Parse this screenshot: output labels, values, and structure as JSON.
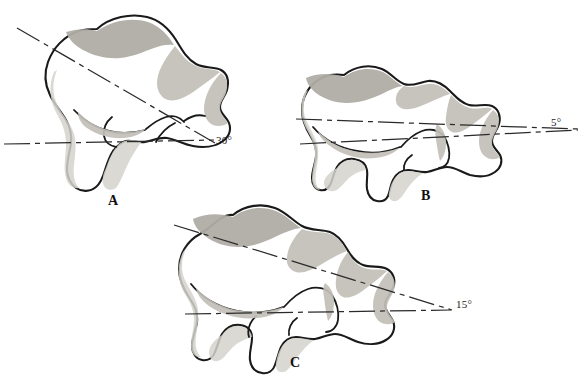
{
  "figure": {
    "background_color": "#ffffff",
    "outline_color": "#1a1a1a",
    "shading_color": "#b8b5ae",
    "width": 585,
    "height": 380
  },
  "panels": [
    {
      "id": "panel-a",
      "label": "A",
      "label_x": 108,
      "label_y": 193,
      "angle_text": "30°",
      "angle_value": 30,
      "angle_label_x": 216,
      "angle_label_y": 134,
      "description": "talus lateral view with steeply inclined neck axis"
    },
    {
      "id": "panel-b",
      "label": "B",
      "label_x": 421,
      "label_y": 188,
      "angle_text": "5°",
      "angle_value": 5,
      "angle_label_x": 551,
      "angle_label_y": 116,
      "description": "talus lateral view with nearly horizontal neck axis"
    },
    {
      "id": "panel-c",
      "label": "C",
      "label_x": 290,
      "label_y": 355,
      "angle_text": "15°",
      "angle_value": 15,
      "angle_label_x": 456,
      "angle_label_y": 298,
      "description": "talus lateral view with intermediate neck axis"
    }
  ]
}
